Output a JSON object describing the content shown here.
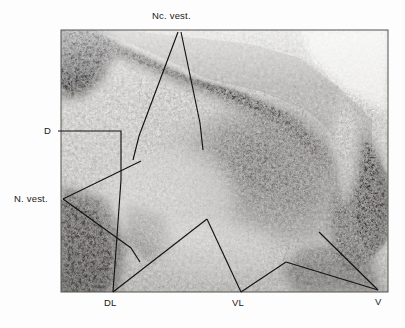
{
  "figure": {
    "kind": "histological-micrograph",
    "plate": {
      "x": 61,
      "y": 30,
      "width": 327,
      "height": 262,
      "border_color": "#5a5a5a",
      "background_color": "#ffffff",
      "tone_light": "#e8e6e2",
      "tone_mid": "#9a968f",
      "tone_dark": "#3a3734",
      "tone_darkest": "#1e1c1a"
    },
    "leader_line_color": "#151515",
    "leader_line_width": 1.15,
    "labels": [
      {
        "id": "nc-vest",
        "text": "Nc. vest.",
        "x": 152,
        "y": 11
      },
      {
        "id": "d",
        "text": "D",
        "x": 44,
        "y": 126
      },
      {
        "id": "n-vest",
        "text": "N. vest.",
        "x": 14,
        "y": 194
      },
      {
        "id": "dl",
        "text": "DL",
        "x": 104,
        "y": 298
      },
      {
        "id": "vl",
        "text": "VL",
        "x": 232,
        "y": 298
      },
      {
        "id": "v",
        "text": "V",
        "x": 375,
        "y": 297
      }
    ],
    "leaders": {
      "nc_vest_left": "M 178 32 L 139 136 L 133 160",
      "nc_vest_right": "M 181 32 L 200 123 L 203 150",
      "d_leader": "M 58 131 L 121 131 L 121 180 L 113 292",
      "n_vest_upper": "M 63 199 L 141 161",
      "n_vest_lower": "M 63 199 L 131 248 L 140 262",
      "dl_right": "M 113 292 L 207 219",
      "vl_leader": "M 207 219 L 241 292",
      "v_upper": "M 378 290 L 319 232",
      "v_lower": "M 378 290 L 286 262",
      "vl_lower_run": "M 241 292 L 286 262"
    }
  }
}
